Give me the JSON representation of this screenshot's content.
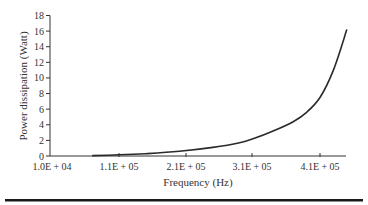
{
  "chart_data": {
    "type": "line",
    "title": "",
    "xlabel": "Frequency (Hz)",
    "ylabel": "Power dissipation (Watt)",
    "xlim": [
      10000,
      450000
    ],
    "ylim": [
      0,
      18
    ],
    "x_ticks": [
      "1.0E + 04",
      "1.1E + 05",
      "2.1E + 05",
      "3.1E + 05",
      "4.1E + 05"
    ],
    "y_ticks": [
      "0",
      "2",
      "4",
      "6",
      "8",
      "10",
      "12",
      "14",
      "16",
      "18"
    ],
    "grid": false,
    "legend": null,
    "series": [
      {
        "name": "Power dissipation",
        "x": [
          70000,
          110000,
          150000,
          200000,
          250000,
          290000,
          310000,
          340000,
          370000,
          390000,
          410000,
          430000,
          450000
        ],
        "y": [
          0.05,
          0.15,
          0.3,
          0.6,
          1.1,
          1.7,
          2.2,
          3.2,
          4.4,
          5.6,
          7.5,
          11.0,
          16.2
        ]
      }
    ]
  }
}
